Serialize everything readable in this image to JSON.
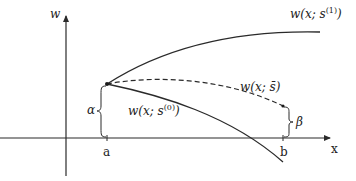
{
  "diagram": {
    "axes": {
      "y_label": "w",
      "x_label": "x"
    },
    "points": {
      "a_label": "a",
      "b_label": "b"
    },
    "curves": {
      "upper": {
        "label_prefix": "w(x; s",
        "label_sup": "(1)",
        "label_suffix": ")",
        "style": "solid"
      },
      "middle": {
        "label": "w(x; s̄)",
        "style": "dashed"
      },
      "lower": {
        "label_prefix": "w(x; s",
        "label_sup": "(0)",
        "label_suffix": ")",
        "style": "solid"
      }
    },
    "braces": {
      "left": "α",
      "right": "β"
    },
    "colors": {
      "line": "#2a2a2a",
      "background": "#ffffff"
    }
  }
}
